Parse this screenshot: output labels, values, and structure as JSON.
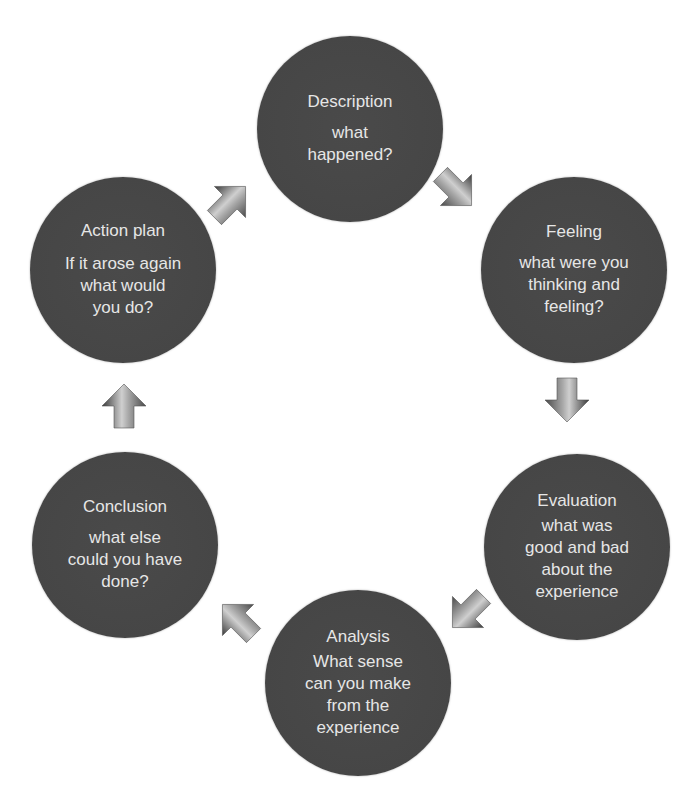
{
  "diagram": {
    "type": "cycle",
    "nodes": [
      {
        "id": "description",
        "title": "Description",
        "subtitle": "what\nhappened?"
      },
      {
        "id": "feeling",
        "title": "Feeling",
        "subtitle": "what were you\nthinking and\nfeeling?"
      },
      {
        "id": "evaluation",
        "title": "Evaluation",
        "subtitle": "what was\ngood and bad\nabout the\nexperience"
      },
      {
        "id": "analysis",
        "title": "Analysis",
        "subtitle": "What sense\ncan you make\nfrom the\nexperience"
      },
      {
        "id": "conclusion",
        "title": "Conclusion",
        "subtitle": "what else\ncould you have\ndone?"
      },
      {
        "id": "action-plan",
        "title": "Action plan",
        "subtitle": "If it arose again\nwhat would\nyou do?"
      }
    ],
    "edges": [
      {
        "from": "description",
        "to": "feeling",
        "direction": "down-right"
      },
      {
        "from": "feeling",
        "to": "evaluation",
        "direction": "down"
      },
      {
        "from": "evaluation",
        "to": "analysis",
        "direction": "down-left"
      },
      {
        "from": "analysis",
        "to": "conclusion",
        "direction": "up-left"
      },
      {
        "from": "conclusion",
        "to": "action-plan",
        "direction": "up"
      },
      {
        "from": "action-plan",
        "to": "description",
        "direction": "up-right"
      }
    ],
    "colors": {
      "node_fill": "#464646",
      "node_rim": "#6a6a6a",
      "node_text": "#e6e6e6",
      "arrow_dark": "#3a3a3a",
      "arrow_light": "#d8d8d8",
      "background": "#ffffff"
    }
  }
}
